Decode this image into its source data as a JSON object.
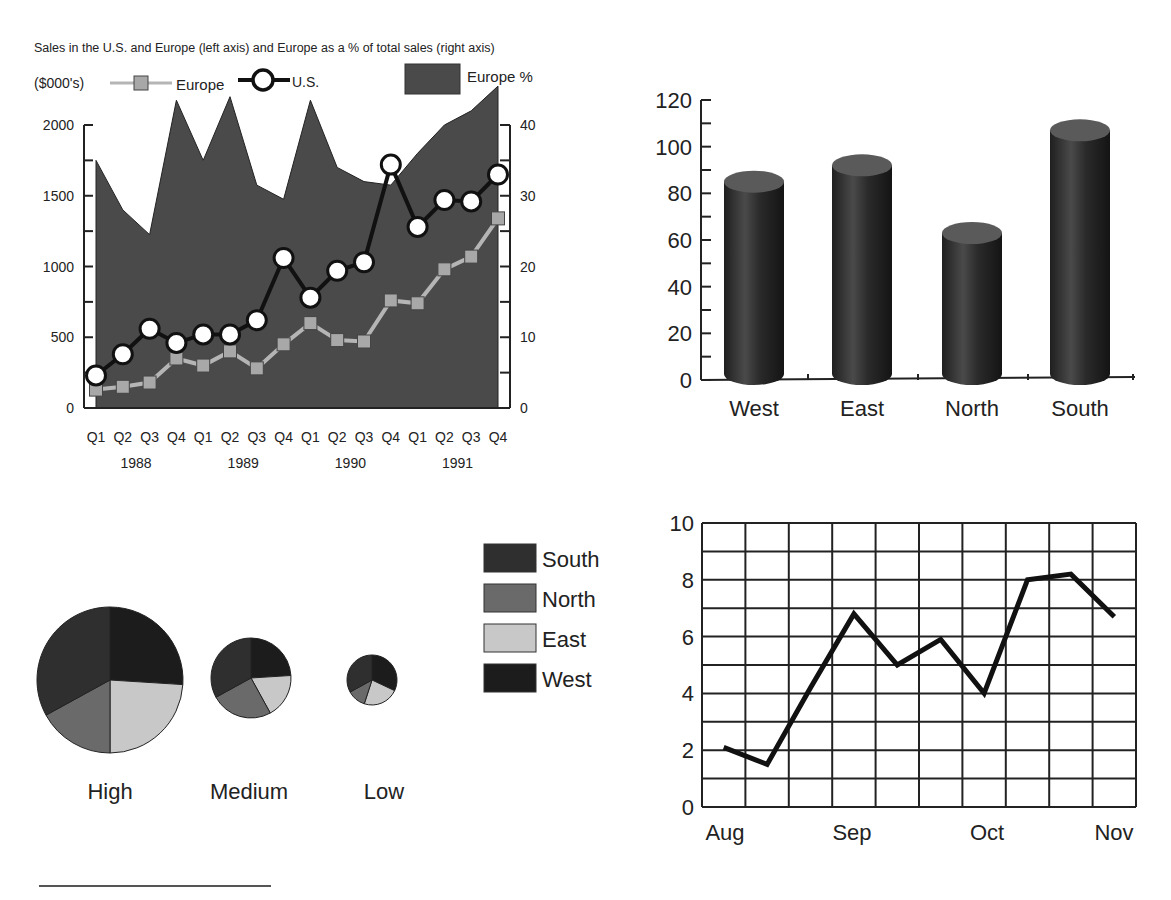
{
  "chart_data": [
    {
      "id": "sales-combo",
      "type": "line+area",
      "title": "Sales in the U.S. and Europe (left axis) and Europe as a % of total sales (right axis)",
      "unit_label": "($000's)",
      "legend": [
        "Europe",
        "U.S.",
        "Europe %"
      ],
      "categories": [
        "Q1",
        "Q2",
        "Q3",
        "Q4",
        "Q1",
        "Q2",
        "Q3",
        "Q4",
        "Q1",
        "Q2",
        "Q3",
        "Q4",
        "Q1",
        "Q2",
        "Q3",
        "Q4"
      ],
      "years": [
        "1988",
        "1989",
        "1990",
        "1991"
      ],
      "left_axis": {
        "ticks": [
          0,
          500,
          1000,
          1500,
          2000
        ],
        "ylim": [
          0,
          2000
        ]
      },
      "right_axis": {
        "ticks": [
          0,
          10,
          20,
          30,
          40
        ],
        "ylim": [
          0,
          40
        ]
      },
      "series": [
        {
          "name": "Europe",
          "axis": "left",
          "style": "line-square",
          "values": [
            130,
            150,
            180,
            350,
            300,
            400,
            280,
            450,
            600,
            480,
            470,
            760,
            740,
            980,
            1070,
            1340
          ]
        },
        {
          "name": "U.S.",
          "axis": "left",
          "style": "line-circle",
          "values": [
            230,
            380,
            560,
            460,
            520,
            520,
            620,
            1060,
            780,
            970,
            1030,
            1720,
            1280,
            1470,
            1460,
            1650
          ]
        },
        {
          "name": "Europe %",
          "axis": "right",
          "style": "area",
          "values": [
            35,
            28,
            24.5,
            43.5,
            35,
            44,
            31.5,
            29.5,
            43.5,
            34,
            32,
            31.5,
            36,
            40,
            42,
            45.5
          ]
        }
      ],
      "grid": false
    },
    {
      "id": "region-cylinders",
      "type": "bar",
      "title": "",
      "categories": [
        "West",
        "East",
        "North",
        "South"
      ],
      "values": [
        85,
        92,
        63,
        107
      ],
      "ylim": [
        0,
        120
      ],
      "yticks": [
        0,
        20,
        40,
        60,
        80,
        100,
        120
      ],
      "xlabel": "",
      "ylabel": "",
      "grid": false
    },
    {
      "id": "region-pies",
      "type": "pie",
      "legend": [
        "South",
        "North",
        "East",
        "West"
      ],
      "pies": [
        {
          "label": "High",
          "values": {
            "West": 26,
            "East": 24,
            "North": 17,
            "South": 33
          }
        },
        {
          "label": "Medium",
          "values": {
            "West": 24,
            "East": 18,
            "North": 25,
            "South": 33
          }
        },
        {
          "label": "Low",
          "values": {
            "West": 32,
            "East": 23,
            "North": 12,
            "South": 33
          }
        }
      ]
    },
    {
      "id": "monthly-line",
      "type": "line",
      "title": "",
      "x_labels": [
        "Aug",
        "Sep",
        "Oct",
        "Nov"
      ],
      "x": [
        0.5,
        1.5,
        2.5,
        3.5,
        4.5,
        5.5,
        6.5,
        7.5,
        8.5,
        9.5
      ],
      "values": [
        2.1,
        1.5,
        4.2,
        6.8,
        5.0,
        5.9,
        4.0,
        8.0,
        8.2,
        6.7
      ],
      "ylim": [
        0,
        10
      ],
      "yticks": [
        0,
        2,
        4,
        6,
        8,
        10
      ],
      "grid": true
    }
  ],
  "colors": {
    "area": "#4a4a4a",
    "europe_line": "#b5b5b5",
    "europe_marker": "#a8a8a8",
    "us_line": "#111111",
    "cylinder_body": "#2e2e2e",
    "cylinder_top": "#5a5a5a",
    "south": "#2f2f2f",
    "north": "#6a6a6a",
    "east": "#c8c8c8",
    "west": "#1c1c1c"
  }
}
